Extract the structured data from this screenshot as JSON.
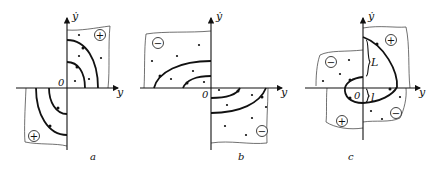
{
  "figure": {
    "panels": [
      {
        "id": "a",
        "caption": "a",
        "x_axis_label": "y",
        "y_axis_label": "ẏ",
        "origin_label": "0",
        "region_signs": [
          "+",
          "+"
        ]
      },
      {
        "id": "b",
        "caption": "b",
        "x_axis_label": "y",
        "y_axis_label": "ẏ",
        "origin_label": "0",
        "region_signs": [
          "−",
          "−"
        ]
      },
      {
        "id": "c",
        "caption": "c",
        "x_axis_label": "y",
        "y_axis_label": "ẏ",
        "origin_label": "0",
        "region_signs": [
          "+",
          "−",
          "+",
          "−"
        ],
        "segment_labels": {
          "upper": "L",
          "lower": "l"
        }
      }
    ]
  }
}
